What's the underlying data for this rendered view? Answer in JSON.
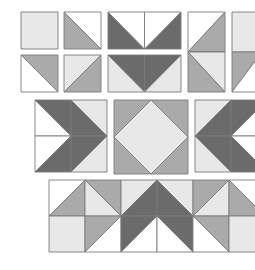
{
  "palette": {
    "white": "#ffffff",
    "light": "#e8e8e8",
    "mid": "#aaaaaa",
    "dark": "#6b6b6b",
    "stroke": "#7a7a7a"
  },
  "blocks": [
    {
      "name": "plain-light-square",
      "kind": "solid",
      "fill": "light"
    },
    {
      "name": "hst-white-mid",
      "kind": "half-square-triangle",
      "colors": [
        "white",
        "mid"
      ]
    },
    {
      "name": "flying-geese-dark-v",
      "kind": "flying-geese",
      "colors": [
        "white",
        "dark"
      ]
    },
    {
      "name": "vertical-geese-mid",
      "kind": "flying-geese-vertical",
      "colors": [
        "white",
        "mid",
        "light"
      ]
    },
    {
      "name": "hst-mid-white",
      "kind": "half-square-triangle",
      "colors": [
        "mid",
        "white"
      ]
    },
    {
      "name": "hst-light-mid",
      "kind": "half-square-triangle",
      "colors": [
        "light",
        "mid"
      ]
    },
    {
      "name": "flying-geese-dark-down",
      "kind": "flying-geese",
      "colors": [
        "dark",
        "light"
      ]
    },
    {
      "name": "geese-arrow-right",
      "kind": "geese-arrow",
      "colors": [
        "white",
        "dark",
        "light"
      ]
    },
    {
      "name": "square-in-a-square",
      "kind": "square-in-a-square",
      "colors": [
        "mid",
        "light"
      ]
    },
    {
      "name": "geese-arrow-left",
      "kind": "geese-arrow",
      "colors": [
        "light",
        "dark",
        "white"
      ]
    },
    {
      "name": "combined-strip",
      "kind": "strip",
      "colors": [
        "white",
        "mid",
        "light",
        "dark"
      ]
    }
  ]
}
